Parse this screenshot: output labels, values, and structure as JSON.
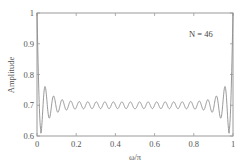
{
  "chart_data": {
    "type": "line",
    "title": "",
    "xlabel": "ω/π",
    "ylabel": "Amplitude",
    "xlim": [
      0,
      1
    ],
    "ylim": [
      0.6,
      1.0
    ],
    "xticks": [
      0,
      0.2,
      0.4,
      0.6,
      0.8,
      1
    ],
    "xtick_labels": [
      "0",
      "0.2",
      "0.4",
      "0.6",
      "0.8",
      "1"
    ],
    "yticks": [
      0.6,
      0.7,
      0.8,
      0.9,
      1.0
    ],
    "ytick_labels": [
      "0.6",
      "0.7",
      "0.8",
      "0.9",
      "1"
    ],
    "grid": false,
    "legend": null,
    "annotations": [
      {
        "text": "N = 46",
        "x": 0.86,
        "y": 0.95
      }
    ],
    "series": [
      {
        "name": "amplitude response",
        "color": "#888888",
        "description": "Starts at 1 at ω=0, drops to ~0.62 near ω/π≈0.02, overshoots to ~0.745, then ripples around 0.70 with decaying amplitude (~±0.01 mid-band, ~23 ripples), mirrored toward ω/π=1 where it dips to ~0.62 near 0.98 and rises back to 1.",
        "x": [
          0,
          0.01,
          0.02,
          0.035,
          0.05,
          0.07,
          0.09,
          0.5,
          0.91,
          0.93,
          0.95,
          0.965,
          0.98,
          0.99,
          1
        ],
        "y": [
          1.0,
          0.8,
          0.62,
          0.7,
          0.745,
          0.685,
          0.725,
          0.7,
          0.725,
          0.685,
          0.745,
          0.7,
          0.62,
          0.8,
          1.0
        ]
      }
    ],
    "model": {
      "center": 0.7,
      "ripples": 23
    }
  },
  "labels": {
    "annotation": "N = 46",
    "xlabel": "ω/π",
    "ylabel": "Amplitude",
    "xticks": [
      "0",
      "0.2",
      "0.4",
      "0.6",
      "0.8",
      "1"
    ],
    "yticks": [
      "1",
      "0.9",
      "0.8",
      "0.7",
      "0.6"
    ]
  }
}
